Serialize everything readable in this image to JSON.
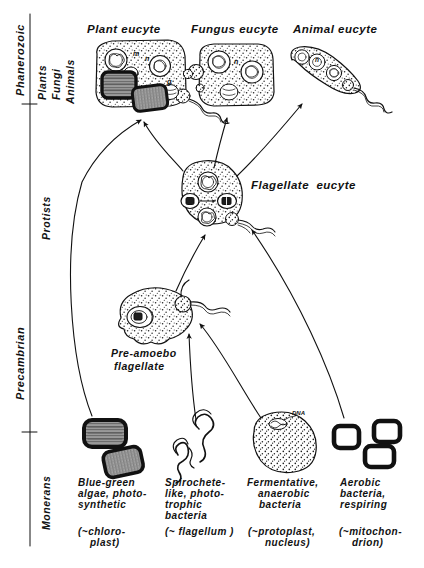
{
  "figure": {
    "domain_note": "Endosymbiosis / serial endosymbiotic theory diagram",
    "axis": {
      "eras": [
        {
          "label": "Phanerozoic"
        },
        {
          "label": "Precambrian"
        }
      ],
      "kingdoms": [
        {
          "label": "Plants"
        },
        {
          "label": "Fungi"
        },
        {
          "label": "Animals"
        },
        {
          "label": "Protists"
        },
        {
          "label": "Monerans"
        }
      ]
    },
    "top_row": [
      {
        "label": "Plant eucyte"
      },
      {
        "label": "Fungus eucyte"
      },
      {
        "label": "Animal eucyte"
      }
    ],
    "middle": {
      "label": "Flagellate  eucyte"
    },
    "protist": {
      "label_line1": "Pre-amoebo",
      "label_line2": "flagellate"
    },
    "monerans": [
      {
        "name": "blue-green-algae",
        "lines": [
          "Blue-green",
          "algae, photo-",
          "synthetic"
        ],
        "paren": [
          "(~chloro-",
          "plast)"
        ]
      },
      {
        "name": "spirochete-bacteria",
        "lines": [
          "Spirochete-",
          "like, photo-",
          "trophic",
          "bacteria"
        ],
        "paren": [
          "(~ flagellum )"
        ]
      },
      {
        "name": "fermentative-bacteria",
        "lines": [
          "Fermentative,",
          "anaerobic",
          "bacteria"
        ],
        "paren": [
          "(~protoplast,",
          "nucleus)"
        ],
        "annotation": "DNA"
      },
      {
        "name": "aerobic-bacteria",
        "lines": [
          "Aerobic",
          "bacteria,",
          "respiring"
        ],
        "paren": [
          "(~mitochon-",
          "drion)"
        ]
      }
    ],
    "organelle_marks": {
      "plant": [
        "m",
        "n",
        "g"
      ],
      "fungus": [
        "n"
      ],
      "animal": [
        "n"
      ],
      "flagellate": [
        "n"
      ]
    },
    "colors": {
      "ink": "#111111",
      "chloroplast_dark": "#1a1a1a",
      "chloroplast_fill": "#8a8a8a",
      "stipple": "#222222"
    }
  }
}
